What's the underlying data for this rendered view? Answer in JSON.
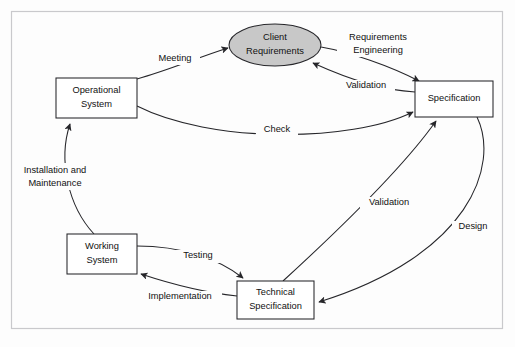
{
  "figure": {
    "kind": "software-lifecycle-diagram",
    "frame": {
      "visible": true,
      "color": "#c9c9cc"
    },
    "background": "#fdfdfd",
    "line_color": "#26262a",
    "accent_fill": "#c8c8c8"
  },
  "nodes": [
    {
      "id": "client-requirements",
      "shape": "ellipse",
      "lines": [
        "Client",
        "Requirements"
      ],
      "fill": "#c8c8c8",
      "cx": 275,
      "cy": 45,
      "rx": 46,
      "ry": 21
    },
    {
      "id": "operational-system",
      "shape": "rect",
      "lines": [
        "Operational",
        "System"
      ],
      "fill": "#ffffff",
      "x": 56,
      "y": 78,
      "w": 81,
      "h": 40
    },
    {
      "id": "specification",
      "shape": "rect",
      "lines": [
        "Specification"
      ],
      "fill": "#ffffff",
      "x": 415,
      "y": 81,
      "w": 78,
      "h": 36
    },
    {
      "id": "working-system",
      "shape": "rect",
      "lines": [
        "Working",
        "System"
      ],
      "fill": "#ffffff",
      "x": 67,
      "y": 234,
      "w": 70,
      "h": 40
    },
    {
      "id": "technical-specification",
      "shape": "rect",
      "lines": [
        "Technical",
        "Specification"
      ],
      "fill": "#ffffff",
      "x": 237,
      "y": 281,
      "w": 77,
      "h": 38
    }
  ],
  "edges": [
    {
      "id": "meeting",
      "label": "Meeting",
      "from": "operational-system",
      "to": "client-requirements",
      "label_x": 175,
      "label_y": 59
    },
    {
      "id": "requirements-engineering",
      "label": "Requirements Engineering",
      "label_lines": [
        "Requirements",
        "Engineering"
      ],
      "from": "client-requirements",
      "to": "specification",
      "label_x": 378,
      "label_y": 44
    },
    {
      "id": "validation-spec-to-client",
      "label": "Validation",
      "from": "specification",
      "to": "client-requirements",
      "label_x": 366,
      "label_y": 86
    },
    {
      "id": "check",
      "label": "Check",
      "from": "operational-system",
      "to": "specification",
      "label_x": 277,
      "label_y": 128
    },
    {
      "id": "installation-and-maintenance",
      "label": "Installation and Maintenance",
      "label_lines": [
        "Installation and",
        "Maintenance"
      ],
      "from": "working-system",
      "to": "operational-system",
      "label_x": 55,
      "label_y": 177
    },
    {
      "id": "testing",
      "label": "Testing",
      "from": "working-system",
      "to": "technical-specification",
      "label_x": 198,
      "label_y": 256
    },
    {
      "id": "implementation",
      "label": "Implementation",
      "from": "technical-specification",
      "to": "working-system",
      "label_x": 180,
      "label_y": 297
    },
    {
      "id": "validation-tech-to-spec",
      "label": "Validation",
      "from": "technical-specification",
      "to": "specification",
      "label_x": 389,
      "label_y": 203
    },
    {
      "id": "design",
      "label": "Design",
      "from": "specification",
      "to": "technical-specification",
      "label_x": 473,
      "label_y": 227
    }
  ]
}
